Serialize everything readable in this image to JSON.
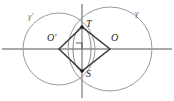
{
  "figure": {
    "type": "geometry-diagram",
    "background_color": "#ffffff",
    "axes": {
      "color": "#8c8c8c",
      "horizontal": {
        "y": 49,
        "x_start": 2,
        "x_end": 172
      },
      "vertical": {
        "x": 82,
        "y_start": 4,
        "y_end": 98
      },
      "origin": {
        "x": 82,
        "y": 49
      }
    },
    "circles": [
      {
        "name": "gamma-prime",
        "label": "γ′",
        "center_label": "O′",
        "cx": 59,
        "cy": 49,
        "r": 36,
        "color": "#9a9a9a"
      },
      {
        "name": "gamma",
        "label": "γ",
        "center_label": "O",
        "cx": 110,
        "cy": 49,
        "r": 42,
        "color": "#9a9a9a"
      }
    ],
    "rhombus": {
      "name": "rhombus-OTOS",
      "color": "#3a3a3a",
      "vertices": [
        {
          "label": "O′",
          "x": 59,
          "y": 49
        },
        {
          "label": "T",
          "x": 82,
          "y": 27
        },
        {
          "label": "O",
          "x": 110,
          "y": 49
        },
        {
          "label": "S",
          "x": 82,
          "y": 71
        }
      ]
    },
    "lens": {
      "name": "inner-lens",
      "color": "#7a7a7a",
      "cx": 82,
      "cy": 49,
      "rx": 9,
      "ry": 22
    },
    "right_angle_marker": {
      "name": "right-angle-marker",
      "x": 82,
      "y": 49,
      "size": 6,
      "color": "#4a4a4a"
    },
    "points": [
      {
        "name": "point-T",
        "label": "T",
        "x": 82,
        "y": 27,
        "label_x": 86,
        "label_y": 20
      },
      {
        "name": "point-S",
        "label": "S",
        "x": 82,
        "y": 71,
        "label_x": 86,
        "label_y": 70
      },
      {
        "name": "point-O-prime",
        "label": "O′",
        "x": 59,
        "y": 49,
        "label_x": 47,
        "label_y": 36
      },
      {
        "name": "point-O",
        "label": "O",
        "x": 110,
        "y": 49,
        "label_x": 111,
        "label_y": 36
      }
    ],
    "curve_labels": [
      {
        "name": "gamma-prime-label",
        "label": "γ′",
        "x": 28,
        "y": 16
      },
      {
        "name": "gamma-label",
        "label": "γ",
        "x": 135,
        "y": 13
      }
    ]
  }
}
